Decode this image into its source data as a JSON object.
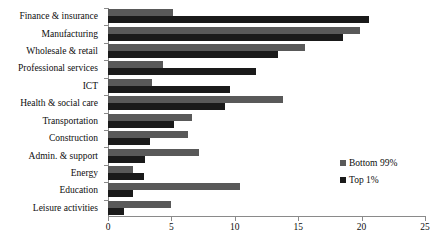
{
  "chart_data": {
    "type": "bar",
    "orientation": "horizontal",
    "title": "",
    "subtitle": "",
    "xlabel": "",
    "ylabel": "",
    "xlim": [
      0,
      25
    ],
    "xticks": [
      0,
      5,
      10,
      15,
      20,
      25
    ],
    "xtick_labels": [
      "0",
      "5",
      "10",
      "15",
      "20",
      "25"
    ],
    "grid": false,
    "legend_position": "inside-right",
    "categories": [
      "Finance & insurance",
      "Manufacturing",
      "Wholesale & retail",
      "Professional services",
      "ICT",
      "Health & social care",
      "Transportation",
      "Construction",
      "Admin. & support",
      "Energy",
      "Education",
      "Leisure activities"
    ],
    "series": [
      {
        "name": "Bottom 99%",
        "color": "#595959",
        "values": [
          5.1,
          19.9,
          15.5,
          4.3,
          3.5,
          13.8,
          6.6,
          6.3,
          7.2,
          2.0,
          10.4,
          5.0
        ]
      },
      {
        "name": "Top 1%",
        "color": "#1a1a1a",
        "values": [
          20.6,
          18.5,
          13.4,
          11.7,
          9.6,
          9.2,
          5.2,
          3.3,
          2.9,
          2.8,
          2.0,
          1.3
        ]
      }
    ]
  },
  "legend": {
    "items": [
      {
        "label": "Bottom 99%",
        "color": "#595959"
      },
      {
        "label": "Top 1%",
        "color": "#1a1a1a"
      }
    ]
  }
}
